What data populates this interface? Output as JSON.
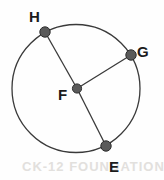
{
  "figure": {
    "type": "geometry-circle-diagram",
    "background_color": "#fefefe",
    "stroke_color": "#3a3a3a",
    "point_fill_color": "#5a5a5a",
    "point_stroke_color": "#2e2e2e",
    "label_color": "#1b1b1b",
    "circle": {
      "name": "circle-F",
      "center_label": "F",
      "cx": 76,
      "cy": 88.5,
      "r": 64,
      "stroke_width": 1.3
    },
    "center_point": {
      "label": "F",
      "x": 77,
      "y": 88.5,
      "dot_r": 4.6,
      "label_x": 58,
      "label_y": 100
    },
    "points": [
      {
        "label": "H",
        "x": 45,
        "y": 32,
        "dot_r": 5.2,
        "label_x": 29,
        "label_y": 22
      },
      {
        "label": "G",
        "x": 131,
        "y": 55,
        "dot_r": 5.2,
        "label_x": 137,
        "label_y": 57
      },
      {
        "label": "E",
        "x": 106,
        "y": 146,
        "dot_r": 5.2,
        "label_x": 109,
        "label_y": 172
      }
    ],
    "radii": [
      {
        "name": "radius-FH",
        "from": "F",
        "to": "H",
        "x1": 77,
        "y1": 88.5,
        "x2": 45,
        "y2": 32
      },
      {
        "name": "radius-FG",
        "from": "F",
        "to": "G",
        "x1": 77,
        "y1": 88.5,
        "x2": 131,
        "y2": 55
      },
      {
        "name": "radius-FE",
        "from": "F",
        "to": "E",
        "x1": 77,
        "y1": 88.5,
        "x2": 106,
        "y2": 146
      }
    ],
    "watermark": {
      "text": "CK-12 FOUNDATION",
      "x": 22,
      "y": 171
    }
  }
}
